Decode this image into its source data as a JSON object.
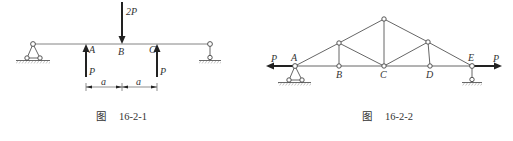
{
  "figures": [
    {
      "id": "fig1",
      "caption": {
        "prefix": "图",
        "number": "16-2-1"
      },
      "type": "simply-supported beam",
      "points": {
        "A": "A",
        "B": "B",
        "C": "C"
      },
      "loads": [
        {
          "label": "2P",
          "at": "B",
          "direction": "down"
        },
        {
          "label": "P",
          "at": "A",
          "direction": "up"
        },
        {
          "label": "P",
          "at": "C",
          "direction": "up"
        }
      ],
      "dimensions": [
        {
          "label": "a",
          "from": "A",
          "to": "B"
        },
        {
          "label": "a",
          "from": "B",
          "to": "C"
        }
      ],
      "supports": {
        "left": "pin",
        "right": "roller"
      }
    },
    {
      "id": "fig2",
      "caption": {
        "prefix": "图",
        "number": "16-2-2"
      },
      "type": "truss",
      "nodes": {
        "A": "A",
        "B": "B",
        "C": "C",
        "D": "D",
        "E": "E"
      },
      "loads": [
        {
          "label": "P",
          "at": "A",
          "direction": "left"
        },
        {
          "label": "P",
          "at": "E",
          "direction": "right"
        }
      ],
      "supports": {
        "left": "pin",
        "right": "roller"
      }
    }
  ]
}
